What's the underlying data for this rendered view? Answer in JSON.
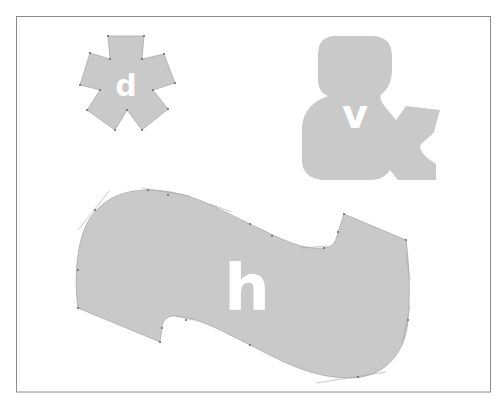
{
  "diagram": {
    "frame": {
      "border_color": "#8c8c8c",
      "background": "#ffffff"
    },
    "fill_color": "#c9c9c9",
    "label_color": "#ffffff",
    "shapes": [
      {
        "id": "star",
        "kind": "five-point star polygon",
        "label": "d"
      },
      {
        "id": "ampersand",
        "kind": "ampersand glyph silhouette",
        "label": "v"
      },
      {
        "id": "tilde",
        "kind": "tilde / wave bezier shape",
        "label": "h"
      }
    ]
  }
}
